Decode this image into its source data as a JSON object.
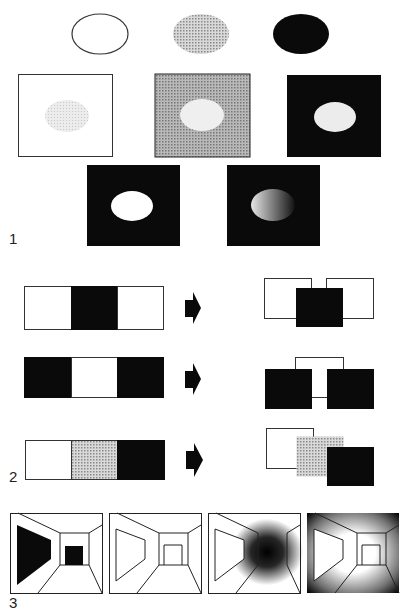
{
  "figure": {
    "labels": {
      "panel1": "1",
      "panel2": "2",
      "panel3": "3"
    },
    "colors": {
      "black": "#0a0a0a",
      "white": "#ffffff",
      "grey": "#bdbdbd",
      "light_grey": "#e3e3e3",
      "mid_grey": "#a8a8a8",
      "stroke": "#333333"
    },
    "panel1": {
      "description": "Brightness contrast: same grey ellipse on white, grey and black backgrounds",
      "ellipses_top": [
        {
          "name": "outline-ellipse",
          "fill": "none"
        },
        {
          "name": "grey-ellipse",
          "fill": "grey"
        },
        {
          "name": "black-ellipse",
          "fill": "black"
        }
      ],
      "squares_row2": [
        {
          "name": "white-bg-square",
          "bg": "white",
          "ellipse": "light_grey"
        },
        {
          "name": "grey-bg-square",
          "bg": "mid_grey",
          "ellipse": "light_grey"
        },
        {
          "name": "black-bg-square",
          "bg": "black",
          "ellipse": "light_grey"
        }
      ],
      "squares_row3": [
        {
          "name": "black-bg-white-ellipse",
          "bg": "black",
          "ellipse": "white"
        },
        {
          "name": "black-bg-gradient-ellipse",
          "bg": "black",
          "ellipse": "gradient"
        }
      ]
    },
    "panel2": {
      "description": "Figure-ground: three-segment bars interpreted as overlapping squares",
      "rows": [
        {
          "bar": [
            "white",
            "black",
            "white"
          ],
          "result": "black square in front of two white squares"
        },
        {
          "bar": [
            "black",
            "white",
            "black"
          ],
          "result": "white square behind two black squares"
        },
        {
          "bar": [
            "white",
            "grey",
            "black"
          ],
          "result": "stacked white, grey, black squares"
        }
      ],
      "arrow_icon": "right-arrow"
    },
    "panel3": {
      "description": "Corridor perspective drawings with varying shading",
      "corridors": [
        {
          "name": "corridor-solid-shapes"
        },
        {
          "name": "corridor-outline"
        },
        {
          "name": "corridor-dark-center"
        },
        {
          "name": "corridor-dark-edges"
        }
      ]
    }
  }
}
